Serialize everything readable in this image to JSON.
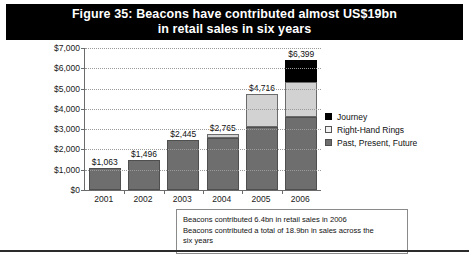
{
  "title": {
    "line1": "Figure 35: Beacons have contributed almost US$19bn",
    "line2": "in retail sales in six years"
  },
  "legend": {
    "items": [
      {
        "label": "Journey",
        "swatch": "black"
      },
      {
        "label": "Right-Hand Rings",
        "swatch": "light"
      },
      {
        "label": "Past, Present, Future",
        "swatch": "gray"
      }
    ]
  },
  "footnote": {
    "line1": "Beacons contributed 6.4bn in retail sales in 2006",
    "line2": "Beacons contributed a total of 18.9bn in sales across the",
    "line3": "six years"
  },
  "chart_data": {
    "type": "bar",
    "stacked": true,
    "title": "Figure 35: Beacons have contributed almost US$19bn in retail sales in six years",
    "xlabel": "",
    "ylabel": "",
    "ylim": [
      0,
      7000
    ],
    "ytick_labels": [
      "$7,000",
      "$6,000",
      "$5,000",
      "$4,000",
      "$3,000",
      "$2,000",
      "$1,000",
      "$0"
    ],
    "ytick_values": [
      7000,
      6000,
      5000,
      4000,
      3000,
      2000,
      1000,
      0
    ],
    "grid": true,
    "legend_position": "right",
    "categories": [
      "2001",
      "2002",
      "2003",
      "2004",
      "2005",
      "2006"
    ],
    "totals": [
      1063,
      1496,
      2445,
      2765,
      4716,
      6399
    ],
    "total_labels": [
      "$1,063",
      "$1,496",
      "$2,445",
      "$2,765",
      "$4,716",
      "$6,399"
    ],
    "series": [
      {
        "name": "Past, Present, Future",
        "color": "#6e6e6e",
        "values": [
          1063,
          1496,
          2445,
          2570,
          3120,
          3620
        ]
      },
      {
        "name": "Right-Hand Rings",
        "color": "#d2d2d2",
        "values": [
          0,
          0,
          0,
          195,
          1596,
          1700
        ]
      },
      {
        "name": "Journey",
        "color": "#000000",
        "values": [
          0,
          0,
          0,
          0,
          0,
          1079
        ]
      }
    ]
  }
}
